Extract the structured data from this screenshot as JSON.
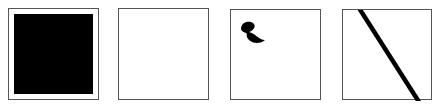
{
  "panels": [
    {
      "id": "panel-1",
      "content": "filled-black-square",
      "fill_color": "#000000"
    },
    {
      "id": "panel-2",
      "content": "empty"
    },
    {
      "id": "panel-3",
      "content": "curl-glyph",
      "glyph_color": "#000000"
    },
    {
      "id": "panel-4",
      "content": "diagonal-line",
      "line_color": "#000000"
    }
  ],
  "colors": {
    "border": "#555555",
    "background": "#ffffff",
    "ink": "#000000"
  }
}
